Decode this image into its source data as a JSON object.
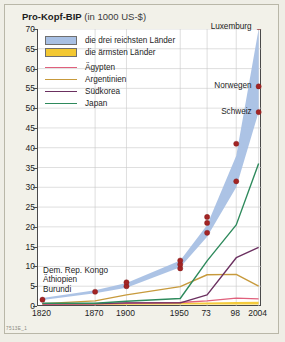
{
  "figure": {
    "title_main": "Pro-Kopf-BIP",
    "title_unit": "(in 1000 US-$)",
    "source_code": "7513E_1"
  },
  "legend": {
    "bands": [
      {
        "label": "die drei reichsten Länder",
        "color": "#a8c0e4"
      },
      {
        "label": "die ärmsten Länder",
        "color": "#f3c832"
      }
    ],
    "lines": [
      {
        "label": "Ägypten",
        "color": "#e0607c"
      },
      {
        "label": "Argentinien",
        "color": "#c79a3c"
      },
      {
        "label": "Südkorea",
        "color": "#6b3060"
      },
      {
        "label": "Japan",
        "color": "#2e8a5c"
      }
    ]
  },
  "annotations": [
    {
      "name": "luxemburg",
      "text": "Luxemburg"
    },
    {
      "name": "norwegen",
      "text": "Norwegen"
    },
    {
      "name": "schweiz",
      "text": "Schweiz"
    },
    {
      "name": "kongo",
      "text": "Dem. Rep. Kongo"
    },
    {
      "name": "aethiopien",
      "text": "Äthiopien"
    },
    {
      "name": "burundi",
      "text": "Burundi"
    }
  ],
  "chart_data": {
    "type": "area",
    "title": "Pro-Kopf-BIP (in 1000 US-$)",
    "xlabel": "",
    "ylabel": "1000 US-$",
    "ylim": [
      0,
      70
    ],
    "yticks": [
      0,
      5,
      10,
      15,
      20,
      25,
      30,
      35,
      40,
      45,
      50,
      55,
      60,
      65,
      70
    ],
    "grid": true,
    "legend_position": "top-left",
    "x": [
      "1820",
      "1870",
      "1900",
      "1950",
      "73",
      "98",
      "2004"
    ],
    "xtick_labels": [
      "1820",
      "1870",
      "1900",
      "1950",
      "73",
      "98",
      "2004"
    ],
    "bands": [
      {
        "name": "die drei reichsten Länder",
        "color": "#a8c0e4",
        "lower": [
          1.5,
          3.2,
          4.6,
          9.8,
          17.5,
          30.0,
          49.0
        ],
        "upper": [
          2.0,
          4.0,
          5.8,
          11.5,
          20.5,
          38.0,
          70.0
        ]
      },
      {
        "name": "die ärmsten Länder",
        "color": "#f3c832",
        "lower": [
          0.3,
          0.3,
          0.3,
          0.4,
          0.4,
          0.4,
          0.4
        ],
        "upper": [
          0.5,
          0.6,
          0.7,
          0.8,
          0.9,
          1.0,
          1.1
        ]
      }
    ],
    "series": [
      {
        "name": "Ägypten",
        "color": "#e0607c",
        "values": [
          0.4,
          0.5,
          0.7,
          0.9,
          1.3,
          2.0,
          1.8
        ]
      },
      {
        "name": "Argentinien",
        "color": "#c79a3c",
        "values": [
          0.6,
          1.3,
          2.8,
          4.9,
          7.9,
          8.0,
          5.0
        ]
      },
      {
        "name": "Südkorea",
        "color": "#6b3060",
        "values": [
          0.6,
          0.6,
          0.8,
          0.8,
          2.8,
          12.2,
          14.8
        ]
      },
      {
        "name": "Japan",
        "color": "#2e8a5c",
        "values": [
          0.7,
          0.7,
          1.2,
          1.9,
          11.4,
          20.5,
          36.0
        ]
      }
    ],
    "markers": {
      "name": "richste-laender-punkte",
      "color": "#a32424",
      "points": [
        {
          "x": "1820",
          "y": 1.6
        },
        {
          "x": "1870",
          "y": 3.6
        },
        {
          "x": "1900",
          "y": 5.0
        },
        {
          "x": "1900",
          "y": 6.0
        },
        {
          "x": "1950",
          "y": 9.5
        },
        {
          "x": "1950",
          "y": 10.5
        },
        {
          "x": "1950",
          "y": 11.5
        },
        {
          "x": "73",
          "y": 18.5
        },
        {
          "x": "73",
          "y": 21.0
        },
        {
          "x": "73",
          "y": 22.5
        },
        {
          "x": "98",
          "y": 31.5
        },
        {
          "x": "98",
          "y": 41.0
        },
        {
          "x": "2004",
          "y": 49.0
        },
        {
          "x": "2004",
          "y": 55.5
        },
        {
          "x": "2004",
          "y": 70.5
        }
      ]
    },
    "point_labels": [
      {
        "text": "Luxemburg",
        "x": "2004",
        "y": 70.5
      },
      {
        "text": "Norwegen",
        "x": "2004",
        "y": 55.5
      },
      {
        "text": "Schweiz",
        "x": "2004",
        "y": 49.0
      }
    ],
    "group_labels": [
      "Dem. Rep. Kongo",
      "Äthiopien",
      "Burundi"
    ]
  }
}
